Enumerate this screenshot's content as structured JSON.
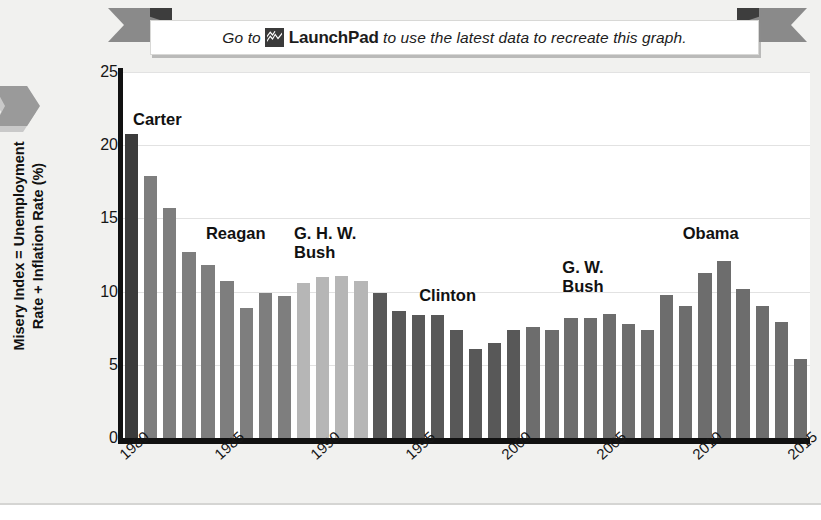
{
  "banner": {
    "text_before": "Go to",
    "brand": "LaunchPad",
    "text_after": "to use the latest data to recreate this graph.",
    "icon": "launchpad-peaks-icon"
  },
  "axes": {
    "y_title_line1": "Misery Index = Unemployment",
    "y_title_line2": "Rate + Inflation Rate (%)",
    "y_ticks": [
      "25",
      "20",
      "15",
      "10",
      "5",
      "0"
    ],
    "x_ticks": [
      "1980",
      "1985",
      "1990",
      "1995",
      "2000",
      "2005",
      "2010",
      "2015"
    ]
  },
  "annotations": [
    {
      "label": "Carter",
      "x_pct": 1.6,
      "y_px": 38
    },
    {
      "label": "Reagan",
      "x_pct": 12.2,
      "y_px": 152
    },
    {
      "label": "G. H. W.\nBush",
      "x_pct": 25.0,
      "y_px": 152
    },
    {
      "label": "Clinton",
      "x_pct": 43.2,
      "y_px": 214
    },
    {
      "label": "G. W.\nBush",
      "x_pct": 64.0,
      "y_px": 186
    },
    {
      "label": "Obama",
      "x_pct": 81.5,
      "y_px": 152
    }
  ],
  "colors": {
    "carter": "#3c3c3c",
    "reagan": "#7e7e7e",
    "ghw_bush": "#b6b6b6",
    "clinton": "#585858",
    "gw_bush": "#6d6d6d",
    "obama": "#6d6d6d",
    "axis": "#111111",
    "grid": "#e2e2e2",
    "plot_bg": "#ffffff",
    "page_bg": "#f1f1ef",
    "ribbon": "#8a8a8a"
  },
  "chart_data": {
    "type": "bar",
    "title": "",
    "xlabel": "",
    "ylabel": "Misery Index = Unemployment Rate + Inflation Rate (%)",
    "ylim": [
      0,
      25
    ],
    "ytick_values": [
      0,
      5,
      10,
      15,
      20,
      25
    ],
    "grid": true,
    "legend": "none",
    "categories": [
      1980,
      1981,
      1982,
      1983,
      1984,
      1985,
      1986,
      1987,
      1988,
      1989,
      1990,
      1991,
      1992,
      1993,
      1994,
      1995,
      1996,
      1997,
      1998,
      1999,
      2000,
      2001,
      2002,
      2003,
      2004,
      2005,
      2006,
      2007,
      2008,
      2009,
      2010,
      2011,
      2012,
      2013,
      2014,
      2015
    ],
    "values": [
      20.8,
      17.9,
      15.7,
      12.7,
      11.8,
      10.7,
      8.9,
      9.9,
      9.7,
      10.6,
      11.0,
      11.1,
      10.7,
      9.9,
      8.7,
      8.4,
      8.4,
      7.4,
      6.1,
      6.5,
      7.4,
      7.6,
      7.4,
      8.2,
      8.2,
      8.5,
      7.8,
      7.4,
      9.8,
      9.0,
      11.3,
      12.1,
      10.2,
      9.0,
      7.9,
      5.4
    ],
    "groups": [
      {
        "name": "Carter",
        "start": 1980,
        "end": 1980,
        "color": "#3c3c3c"
      },
      {
        "name": "Reagan",
        "start": 1981,
        "end": 1988,
        "color": "#7e7e7e"
      },
      {
        "name": "G. H. W. Bush",
        "start": 1989,
        "end": 1992,
        "color": "#b6b6b6"
      },
      {
        "name": "Clinton",
        "start": 1993,
        "end": 2000,
        "color": "#585858"
      },
      {
        "name": "G. W. Bush",
        "start": 2001,
        "end": 2008,
        "color": "#6d6d6d"
      },
      {
        "name": "Obama",
        "start": 2009,
        "end": 2015,
        "color": "#6d6d6d"
      }
    ]
  }
}
